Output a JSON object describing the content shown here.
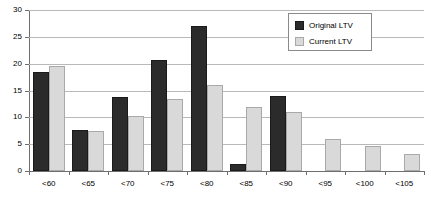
{
  "chart_data": {
    "type": "bar",
    "title": "",
    "subtitle": "",
    "xlabel": "",
    "ylabel": "",
    "categories": [
      "<60",
      "<65",
      "<70",
      "<75",
      "<80",
      "<85",
      "<90",
      "<95",
      "<100",
      "<105"
    ],
    "series": [
      {
        "name": "Original LTV",
        "color": "#2b2b2b",
        "values": [
          18.5,
          7.7,
          13.8,
          20.7,
          27.0,
          1.4,
          14.0,
          0,
          0,
          0
        ]
      },
      {
        "name": "Current LTV",
        "color": "#d9d9d9",
        "values": [
          19.6,
          7.4,
          10.2,
          13.5,
          16.0,
          12.0,
          11.0,
          6.0,
          4.7,
          3.2
        ]
      }
    ],
    "ylim": [
      0,
      30
    ],
    "yticks": [
      0,
      5,
      10,
      15,
      20,
      25,
      30
    ],
    "ytick_labels": [
      "0",
      "5",
      "10",
      "15",
      "20",
      "25",
      "30"
    ],
    "grid": true,
    "grid_axis": "y",
    "legend_position": "top-right",
    "legend_entries": [
      "Original LTV",
      "Current LTV"
    ]
  },
  "legend": {
    "items": [
      {
        "label": "Original LTV",
        "swatch": "legend-swatch-original"
      },
      {
        "label": "Current LTV",
        "swatch": "legend-swatch-current"
      }
    ]
  },
  "colors": {
    "original": "#2b2b2b",
    "current": "#d9d9d9",
    "grid": "#b9b9b9",
    "axis": "#6e6e6e",
    "background": "#ffffff"
  }
}
